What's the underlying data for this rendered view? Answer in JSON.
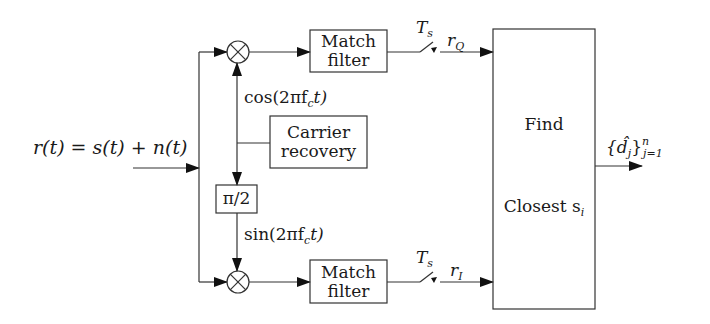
{
  "diagram": {
    "type": "block-diagram",
    "input": {
      "label": "r(t) = s(t) + n(t)"
    },
    "blocks": [
      {
        "id": "mixer-top",
        "label": "⊗"
      },
      {
        "id": "mixer-bottom",
        "label": "⊗"
      },
      {
        "id": "match-filter-top",
        "line1": "Match",
        "line2": "filter"
      },
      {
        "id": "match-filter-bottom",
        "line1": "Match",
        "line2": "filter"
      },
      {
        "id": "carrier-recovery",
        "line1": "Carrier",
        "line2": "recovery"
      },
      {
        "id": "phase-shift",
        "label": "π/2"
      },
      {
        "id": "decision",
        "line1": "Find",
        "line2": "Closest s",
        "line2_sub": "i"
      }
    ],
    "signals": {
      "cos": "cos(2πf",
      "cos_sub": "c",
      "cos_tail": "t)",
      "sin": "sin(2πf",
      "sin_sub": "c",
      "sin_tail": "t)",
      "sampler_top": "T",
      "sampler_top_sub": "s",
      "sampler_bottom": "T",
      "sampler_bottom_sub": "s",
      "rq": "r",
      "rq_sub": "Q",
      "ri": "r",
      "ri_sub": "I",
      "output": "{d̂",
      "output_sub": "j",
      "output_tail": "}",
      "output_sup": "n",
      "output_sub2": "j=1"
    }
  }
}
